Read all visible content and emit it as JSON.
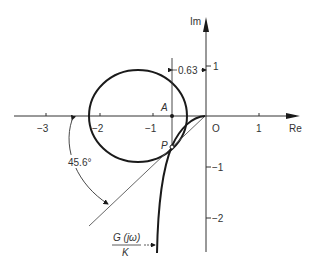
{
  "figure": {
    "type": "nyquist-plot-with-m-circle",
    "axes": {
      "real_label": "Re",
      "imag_label": "Im",
      "real_ticks": [
        "−3",
        "−2",
        "−1",
        "O",
        "1"
      ],
      "imag_ticks": [
        "1",
        "−1",
        "−2"
      ]
    },
    "annotations": {
      "dimension_label": "0.63",
      "point_a": "A",
      "point_p": "P",
      "angle_label": "45.6°",
      "curve_label_num": "G (jω)",
      "curve_label_den": "K"
    },
    "elements": [
      {
        "name": "m-circle",
        "center_re": -1.27,
        "center_im": 0,
        "radius": 0.92
      },
      {
        "name": "g-jw-over-k-curve",
        "passes_through": "P"
      },
      {
        "name": "tangent-line",
        "angle_deg": 45.6
      },
      {
        "name": "vertical-line-A-to-P",
        "re": -0.63
      }
    ],
    "colors": {
      "ink": "#1a1a1a",
      "background": "#ffffff"
    }
  }
}
